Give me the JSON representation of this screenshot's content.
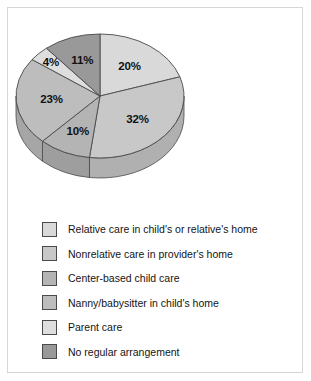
{
  "chart_data": {
    "type": "pie",
    "title": "",
    "subtitle": "",
    "xlabel": "",
    "ylabel": "",
    "three_d": true,
    "start_angle_deg": 0,
    "direction": "clockwise",
    "legend_position": "bottom-left",
    "grid": false,
    "value_unit": "%",
    "categories": [
      "Relative care in child's or relative's home",
      "Nonrelative care in provider's home",
      "Center-based child care",
      "Nanny/babysitter in child's home",
      "Parent care",
      "No regular arrangement"
    ],
    "values": [
      20,
      32,
      10,
      23,
      4,
      11
    ],
    "data_labels": [
      "20%",
      "32%",
      "10%",
      "23%",
      "4%",
      "11%"
    ],
    "colors": [
      "#d9d9d9",
      "#c8c8c8",
      "#b4b4b4",
      "#bdbdbd",
      "#dedede",
      "#999999"
    ],
    "slice_outline_color": "#4a4a4a",
    "slices": [
      {
        "label": "Relative care in child's or relative's home",
        "value": 20,
        "data_label": "20%",
        "color": "#d9d9d9"
      },
      {
        "label": "Nonrelative care in provider's home",
        "value": 32,
        "data_label": "32%",
        "color": "#c8c8c8"
      },
      {
        "label": "Center-based child care",
        "value": 10,
        "data_label": "10%",
        "color": "#b4b4b4"
      },
      {
        "label": "Nanny/babysitter in child's home",
        "value": 23,
        "data_label": "23%",
        "color": "#bdbdbd"
      },
      {
        "label": "Parent care",
        "value": 4,
        "data_label": "4%",
        "color": "#dedede"
      },
      {
        "label": "No regular arrangement",
        "value": 11,
        "data_label": "11%",
        "color": "#999999"
      }
    ]
  },
  "legend": {
    "items": [
      {
        "label": "Relative care in child's or relative's home",
        "color": "#d9d9d9"
      },
      {
        "label": "Nonrelative care in provider's home",
        "color": "#c8c8c8"
      },
      {
        "label": "Center-based child care",
        "color": "#b4b4b4"
      },
      {
        "label": "Nanny/babysitter in child's home",
        "color": "#bdbdbd"
      },
      {
        "label": "Parent care",
        "color": "#dedede"
      },
      {
        "label": "No regular arrangement",
        "color": "#999999"
      }
    ]
  },
  "frame": {
    "border_color": "#d6d6d6",
    "background": "#ffffff"
  }
}
